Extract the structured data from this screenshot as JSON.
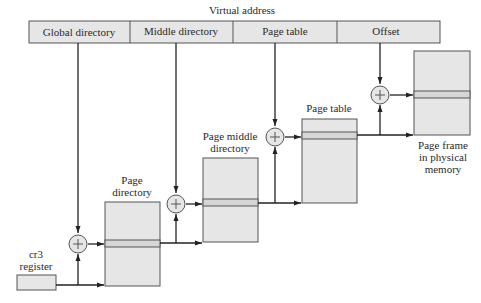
{
  "title": "Virtual address",
  "virtual_address_fields": [
    {
      "label": "Global directory"
    },
    {
      "label": "Middle directory"
    },
    {
      "label": "Page table"
    },
    {
      "label": "Offset"
    }
  ],
  "register": {
    "label_line1": "cr3",
    "label_line2": "register"
  },
  "tables": [
    {
      "label_line1": "Page",
      "label_line2": "directory"
    },
    {
      "label_line1": "Page middle",
      "label_line2": "directory"
    },
    {
      "label_line1": "Page table",
      "label_line2": ""
    },
    {
      "label_line1": "Page frame",
      "label_line2": "in physical",
      "label_line3": "memory"
    }
  ],
  "adder_symbol": "+",
  "colors": {
    "box_fill": "#e6e6e6",
    "stripe_fill": "#d6d6d6",
    "stroke": "#555555",
    "line": "#222222",
    "text": "#2a2a2a"
  }
}
